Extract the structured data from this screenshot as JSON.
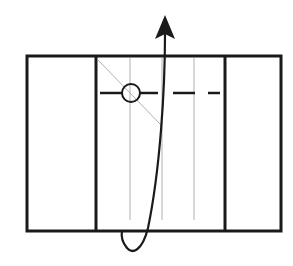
{
  "diagram": {
    "type": "origami-fold-step",
    "colors": {
      "background": "#ffffff",
      "outline": "#1a1a1a",
      "thin_line": "#b0b0b0"
    },
    "elements": {
      "outer_rect": {
        "x": 27,
        "y": 56,
        "w": 254,
        "h": 175
      },
      "flap_lines": [
        {
          "x": 96
        },
        {
          "x": 225
        }
      ],
      "crease_lines": [
        {
          "x": 130
        },
        {
          "x": 162
        },
        {
          "x": 194
        }
      ],
      "diagonal_crease": {
        "x1": 98,
        "y1": 60,
        "x2": 162,
        "y2": 126
      },
      "fold_line_y": 93,
      "pivot_circle": {
        "cx": 131,
        "cy": 93,
        "r": 9
      },
      "arrow_tip": {
        "x": 165,
        "y": 15
      }
    }
  }
}
